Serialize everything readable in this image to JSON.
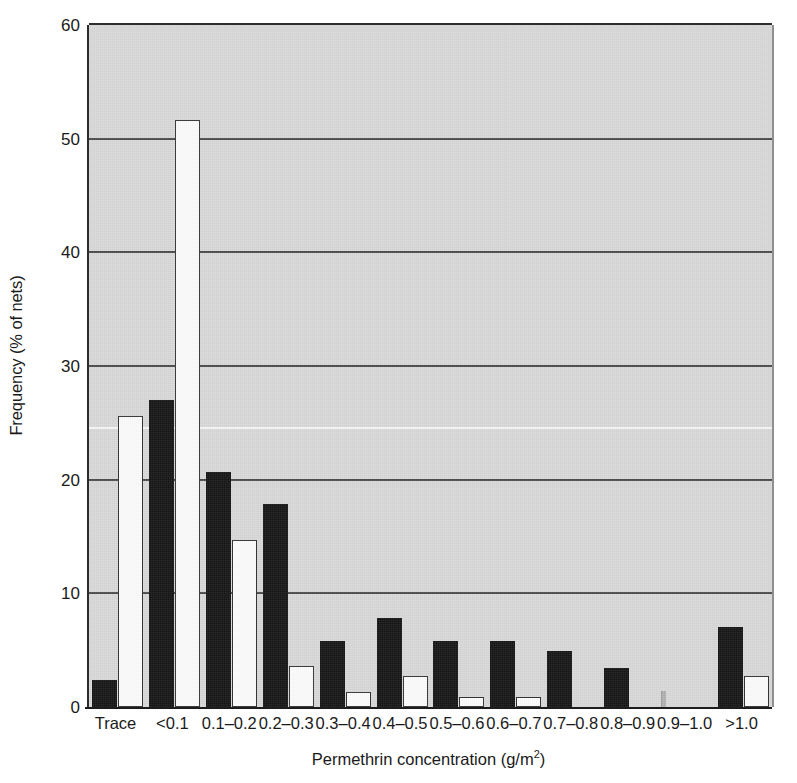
{
  "chart_data": {
    "type": "bar",
    "title": "",
    "xlabel": "Permethrin concentration (g/m2)",
    "xlabel_base": "Permethrin concentration (g/m",
    "xlabel_sup": "2",
    "xlabel_tail": ")",
    "ylabel": "Frequency (% of nets)",
    "categories": [
      "Trace",
      "<0.1",
      "0.1–0.2",
      "0.2–0.3",
      "0.3–0.4",
      "0.4–0.5",
      "0.5–0.6",
      "0.6–0.7",
      "0.7–0.8",
      "0.8–0.9",
      "0.9–1.0",
      ">1.0"
    ],
    "series": [
      {
        "name": "black",
        "color": "#141414",
        "values": [
          2.4,
          27.0,
          20.7,
          17.9,
          5.8,
          7.8,
          5.8,
          5.8,
          4.9,
          3.4,
          0.0,
          7.0
        ]
      },
      {
        "name": "white",
        "color": "#fbfbfb",
        "values": [
          25.6,
          51.6,
          14.7,
          3.6,
          1.3,
          2.7,
          0.9,
          0.9,
          0.0,
          0.0,
          0.0,
          2.7
        ]
      }
    ],
    "ylim": [
      0,
      60
    ],
    "yticks": [
      0,
      10,
      20,
      30,
      40,
      50,
      60
    ],
    "ytick_labels": [
      "0",
      "10",
      "20",
      "30",
      "40",
      "50",
      "60"
    ],
    "grid": true,
    "grid_axis": "y",
    "legend": "none",
    "plot_background": "#d7d7d7"
  }
}
